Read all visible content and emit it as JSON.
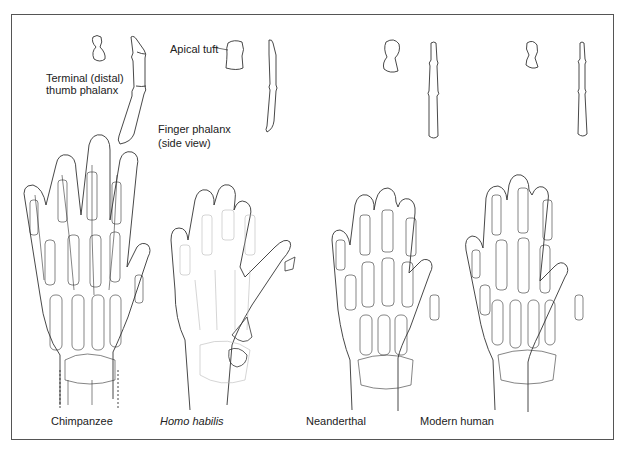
{
  "figure": {
    "annotations": {
      "terminal_line1": "Terminal (distal)",
      "terminal_line2": "thumb phalanx",
      "apical_tuft": "Apical tuft",
      "finger_line1": "Finger phalanx",
      "finger_line2": "(side view)"
    },
    "species": [
      {
        "name": "Chimpanzee",
        "italic": false
      },
      {
        "name": "Homo habilis",
        "italic": true
      },
      {
        "name": "Neanderthal",
        "italic": false
      },
      {
        "name": "Modern human",
        "italic": false
      }
    ],
    "colors": {
      "line": "#333333",
      "faint": "#b8b8b8",
      "border": "#555555"
    }
  }
}
